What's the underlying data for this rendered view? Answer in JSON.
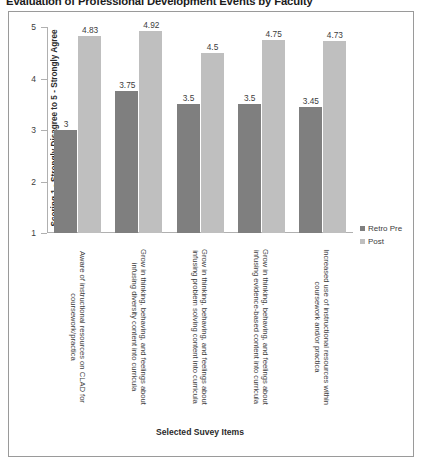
{
  "chart_data": {
    "type": "bar",
    "title": "Evaluation of Professional Development Events by Faculty",
    "xlabel": "Selected Suvey Items",
    "ylabel": "Scoring 1 - Strongly Disagree to 5 - Strongly Agree",
    "ylim": [
      1,
      5
    ],
    "yticks": [
      "5",
      "4",
      "3",
      "2",
      "1"
    ],
    "grid": false,
    "legend_position": "right",
    "categories": [
      "Aware of instructional resources on CLAD for coursework/practica",
      "Grow in thinking, behaving, and feelings about infusing diversity content into curricula",
      "Grow in thinking, behaving, and feelings about infusing problem solving content into curricula",
      "Grow in thinking, behaving, and feelings about infusing evidence-based content into curricula",
      "Increased use of instructional resources within coursework and/or practica"
    ],
    "series": [
      {
        "name": "Retro Pre",
        "color": "#7f7f7f",
        "values": [
          3,
          3.75,
          3.5,
          3.5,
          3.45
        ],
        "labels": [
          "3",
          "3.75",
          "3.5",
          "3.5",
          "3.45"
        ]
      },
      {
        "name": "Post",
        "color": "#bfbfbf",
        "values": [
          4.83,
          4.92,
          4.5,
          4.75,
          4.73
        ],
        "labels": [
          "4.83",
          "4.92",
          "4.5",
          "4.75",
          "4.73"
        ]
      }
    ]
  }
}
